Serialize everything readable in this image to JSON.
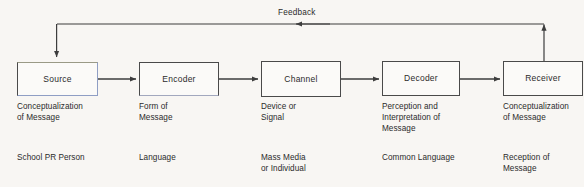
{
  "diagram": {
    "background_color": "#f8f6f3",
    "line_color": "#3d3d3d",
    "text_color": "#2b2b2b",
    "feedback": {
      "label": "Feedback",
      "direction": "right-to-left",
      "from": "Receiver",
      "to": "Source"
    },
    "nodes": [
      {
        "id": "source",
        "label": "Source",
        "description": "Conceptualization\nof Message",
        "example": "School PR Person"
      },
      {
        "id": "encoder",
        "label": "Encoder",
        "description": "Form of\nMessage",
        "example": "Language"
      },
      {
        "id": "channel",
        "label": "Channel",
        "description": "Device or\nSignal",
        "example": "Mass Media\nor Individual"
      },
      {
        "id": "decoder",
        "label": "Decoder",
        "description": "Perception and\nInterpretation of\nMessage",
        "example": "Common Language"
      },
      {
        "id": "receiver",
        "label": "Receiver",
        "description": "Conceptualization\nof Message",
        "example": "Reception of\nMessage"
      }
    ]
  }
}
